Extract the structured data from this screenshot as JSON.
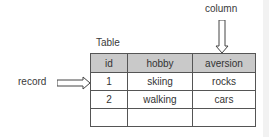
{
  "diagram": {
    "title": "Table",
    "column_annotation": "column",
    "record_annotation": "record",
    "table": {
      "headers": [
        "id",
        "hobby",
        "aversion"
      ],
      "rows": [
        [
          "1",
          "skiing",
          "rocks"
        ],
        [
          "2",
          "walking",
          "cars"
        ],
        [
          "",
          "",
          ""
        ]
      ]
    },
    "colors": {
      "header_bg": "#c9c9c9",
      "border": "#555555"
    }
  }
}
